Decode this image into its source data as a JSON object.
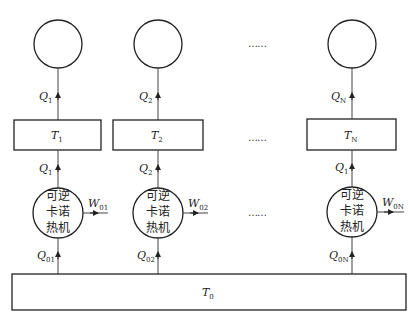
{
  "diagram": {
    "columns": [
      {
        "heat_out": "Q",
        "heat_out_sub": "1",
        "reservoir": "T",
        "reservoir_sub": "1",
        "heat_in": "Q",
        "heat_in_sub": "1",
        "work": "W",
        "work_sub": "01",
        "source_heat": "Q",
        "source_heat_sub": "01"
      },
      {
        "heat_out": "Q",
        "heat_out_sub": "2",
        "reservoir": "T",
        "reservoir_sub": "2",
        "heat_in": "Q",
        "heat_in_sub": "2",
        "work": "W",
        "work_sub": "02",
        "source_heat": "Q",
        "source_heat_sub": "02"
      },
      {
        "heat_out": "Q",
        "heat_out_sub": "N",
        "reservoir": "T",
        "reservoir_sub": "N",
        "heat_in": "Q",
        "heat_in_sub": "1",
        "work": "W",
        "work_sub": "0N",
        "source_heat": "Q",
        "source_heat_sub": "0N"
      }
    ],
    "engine_label": [
      "可逆",
      "卡诺",
      "热机"
    ],
    "ellipsis": "……",
    "bottom_reservoir": "T",
    "bottom_reservoir_sub": "0"
  }
}
